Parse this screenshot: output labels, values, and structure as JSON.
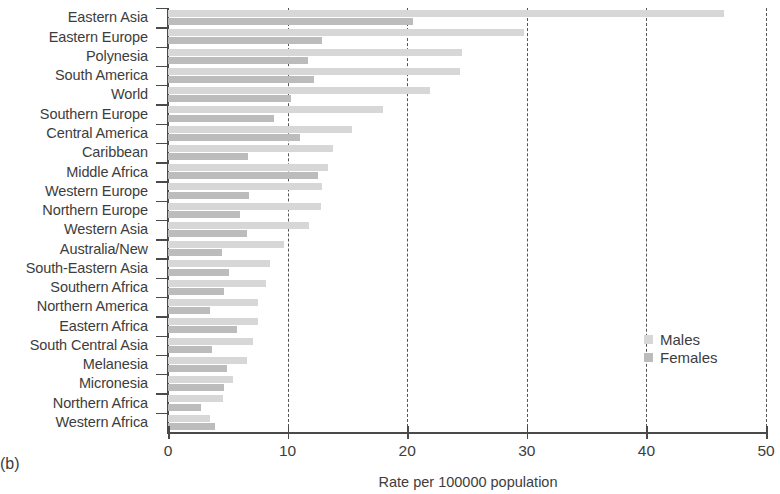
{
  "panel": {
    "label": "(b)"
  },
  "legend": {
    "position": "center-right",
    "entries": [
      {
        "name": "Males",
        "color": "#d7d7d7"
      },
      {
        "name": "Females",
        "color": "#bcbcbc"
      }
    ]
  },
  "axis": {
    "x_title": "Rate per 100000 population",
    "x_ticks": [
      "0",
      "10",
      "20",
      "30",
      "40",
      "50"
    ],
    "x_tick_values": [
      0,
      10,
      20,
      30,
      40,
      50
    ],
    "x_min": 0,
    "x_max": 50,
    "grid": "vertical-dashed"
  },
  "chart_data": {
    "type": "bar",
    "orientation": "horizontal",
    "title": "",
    "subtitle": "",
    "xlabel": "Rate per 100000 population",
    "ylabel": "",
    "xlim": [
      0,
      50
    ],
    "grid": true,
    "legend_position": "center-right",
    "categories": [
      "Eastern Asia",
      "Eastern Europe",
      "Polynesia",
      "South America",
      "World",
      "Southern Europe",
      "Central America",
      "Caribbean",
      "Middle Africa",
      "Western Europe",
      "Northern Europe",
      "Western Asia",
      "Australia/New",
      "South-Eastern Asia",
      "Southern Africa",
      "Northern America",
      "Eastern Africa",
      "South Central Asia",
      "Melanesia",
      "Micronesia",
      "Northern Africa",
      "Western Africa"
    ],
    "series": [
      {
        "name": "Males",
        "color": "#d7d7d7",
        "values": [
          46.5,
          29.8,
          24.6,
          24.4,
          21.9,
          18.0,
          15.4,
          13.8,
          13.4,
          12.9,
          12.8,
          11.8,
          9.7,
          8.5,
          8.2,
          7.5,
          7.5,
          7.1,
          6.6,
          5.4,
          4.6,
          3.5
        ]
      },
      {
        "name": "Females",
        "color": "#bcbcbc",
        "values": [
          20.5,
          12.9,
          11.7,
          12.2,
          10.3,
          8.9,
          11.0,
          6.7,
          12.5,
          6.8,
          6.0,
          6.6,
          4.5,
          5.1,
          4.7,
          3.5,
          5.8,
          3.7,
          4.9,
          4.7,
          2.8,
          3.9
        ]
      }
    ]
  }
}
